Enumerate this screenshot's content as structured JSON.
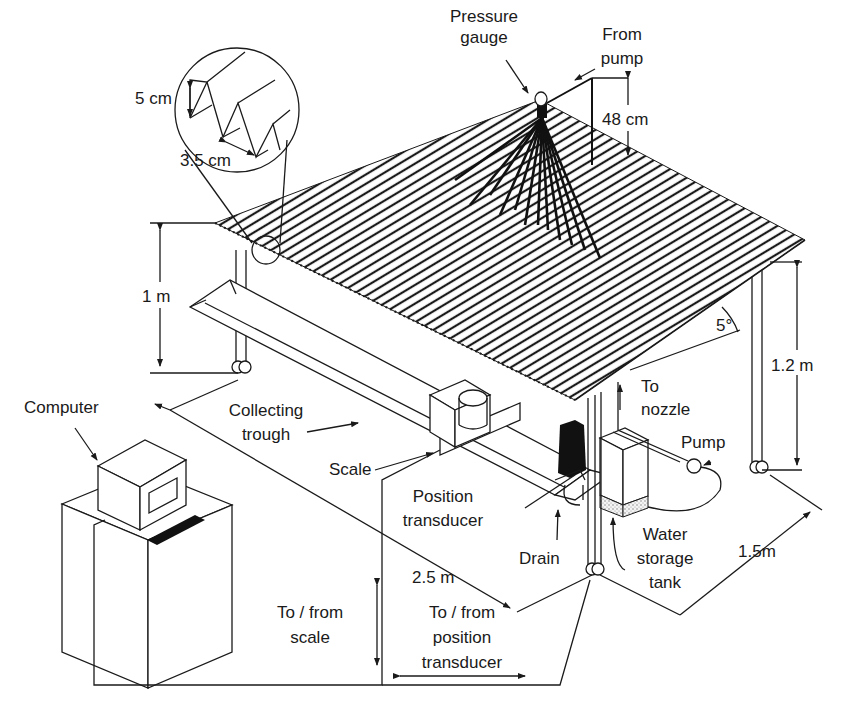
{
  "figure": {
    "colors": {
      "line": "#1a1a1a",
      "background": "#ffffff",
      "fill_dark": "#111111"
    }
  },
  "labels": {
    "pressure_gauge": [
      "Pressure",
      "gauge"
    ],
    "from_pump": [
      "From",
      "pump"
    ],
    "nozzle_height": "48 cm",
    "corrugation_height": "5 cm",
    "corrugation_pitch": "3.5 cm",
    "low_side_height": "1 m",
    "high_side_height": "1.2 m",
    "slope_angle": "5°",
    "to_nozzle": [
      "To",
      "nozzle"
    ],
    "pump": "Pump",
    "computer": "Computer",
    "collecting_trough": [
      "Collecting",
      "trough"
    ],
    "scale": "Scale",
    "position_transducer": [
      "Position",
      "transducer"
    ],
    "drain": "Drain",
    "water_storage_tank": [
      "Water",
      "storage",
      "tank"
    ],
    "length": "2.5 m",
    "width": "1.5m",
    "to_from_scale": [
      "To / from",
      "scale"
    ],
    "to_from_position_transducer": [
      "To / from",
      "position",
      "transducer"
    ]
  }
}
